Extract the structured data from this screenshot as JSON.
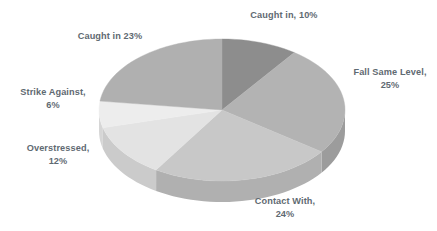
{
  "chart_data": {
    "type": "pie",
    "title": "",
    "subtitle": "",
    "xlabel": "",
    "ylabel": "",
    "legend_position": "none",
    "grid": false,
    "labels_outside": true,
    "categories": [
      "Caught in",
      "Fall Same Level",
      "Contact With",
      "Overstressed",
      "Strike Against",
      "Caught in"
    ],
    "values": [
      10,
      25,
      24,
      12,
      6,
      23
    ],
    "value_suffix": "%",
    "slices": [
      {
        "name": "Caught in",
        "value": 10,
        "label": "Caught in, 10%",
        "color": "#8d8d8d",
        "side_color": "#7b7b7b",
        "start_angle": 0,
        "end_angle": 36
      },
      {
        "name": "Fall Same Level",
        "value": 25,
        "label": "Fall Same Level,\n25%",
        "color": "#b3b3b3",
        "side_color": "#9c9c9c",
        "start_angle": 36,
        "end_angle": 126
      },
      {
        "name": "Contact With",
        "value": 24,
        "label": "Contact With,\n24%",
        "color": "#c8c8c8",
        "side_color": "#b0b0b0",
        "start_angle": 126,
        "end_angle": 212.4
      },
      {
        "name": "Overstressed",
        "value": 12,
        "label": "Overstressed,\n12%",
        "color": "#e3e3e3",
        "side_color": "#cbcbcb",
        "start_angle": 212.4,
        "end_angle": 255.6
      },
      {
        "name": "Strike Against",
        "value": 6,
        "label": "Strike Against,\n6%",
        "color": "#ededed",
        "side_color": "#d6d6d6",
        "start_angle": 255.6,
        "end_angle": 277.2
      },
      {
        "name": "Caught in",
        "value": 23,
        "label": "Caught in 23%",
        "color": "#b0b0b0",
        "side_color": "#9a9a9a",
        "start_angle": 277.2,
        "end_angle": 360
      }
    ],
    "geometry": {
      "center_x": 222,
      "center_y": 110,
      "radius_x": 123,
      "radius_y": 71,
      "depth": 21
    },
    "text_color": "#5f6a72",
    "background_color": "#ffffff"
  },
  "labels": {
    "caught_in_10": "Caught in, 10%",
    "fall_same_level_25": "Fall Same Level,\n25%",
    "contact_with_24": "Contact With,\n24%",
    "overstressed_12": "Overstressed,\n12%",
    "strike_against_6": "Strike Against,\n6%",
    "caught_in_23": "Caught in 23%"
  }
}
